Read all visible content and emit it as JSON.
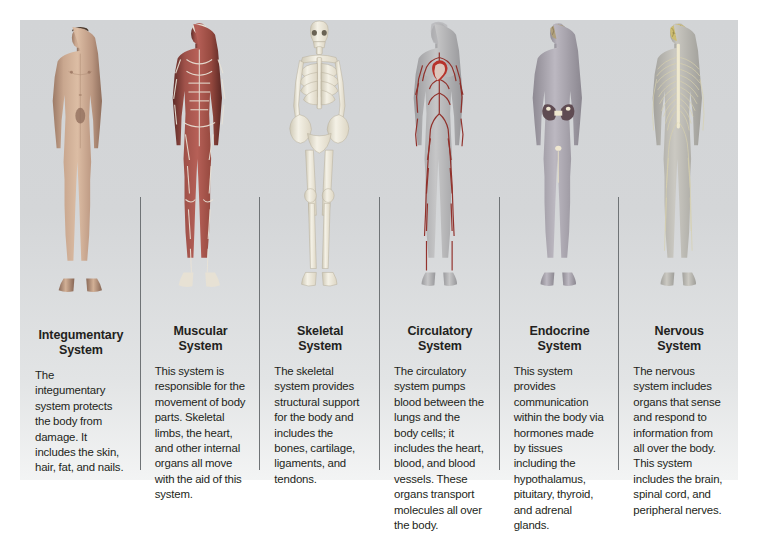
{
  "figure": {
    "top_clipped_text": "",
    "background_color": "#d3d5d7",
    "text_color": "#231f20",
    "divider_color": "#6f7376",
    "columns": [
      {
        "id": "integumentary",
        "title": "Integumentary\nSystem",
        "description": "The integumentary system protects the body from damage. It includes the skin, hair, fat, and nails.",
        "figure_name": "integumentary-body-figure",
        "figure_alt": "Front view of a male body showing intact skin",
        "accent": "#b08a72"
      },
      {
        "id": "muscular",
        "title": "Muscular\nSystem",
        "description": "This system is responsible for the movement of body parts. Skeletal limbs, the heart, and other internal organs all move with the aid of this system.",
        "figure_name": "muscular-body-figure",
        "figure_alt": "Front view of a body showing skeletal muscles",
        "accent": "#8c4a44"
      },
      {
        "id": "skeletal",
        "title": "Skeletal\nSystem",
        "description": "The skeletal system provides structural support for the body and includes the bones, cartilage, ligaments, and tendons.",
        "figure_name": "skeletal-body-figure",
        "figure_alt": "Front view of a human skeleton",
        "accent": "#efece2"
      },
      {
        "id": "circulatory",
        "title": "Circulatory\nSystem",
        "description": "The circulatory system pumps blood between the lungs and the body cells; it includes the heart, blood, and blood vessels. These organs transport molecules all over the body.",
        "figure_name": "circulatory-body-figure",
        "figure_alt": "Front view of a body showing heart and blood vessels",
        "accent": "#9e3b34"
      },
      {
        "id": "endocrine",
        "title": "Endocrine\nSystem",
        "description": "This system provides communication within the body via hormones made by tissues including the hypothalamus, pituitary, thyroid, and adrenal glands.",
        "figure_name": "endocrine-body-figure",
        "figure_alt": "Front view of a body showing endocrine glands",
        "accent": "#7d6a86"
      },
      {
        "id": "nervous",
        "title": "Nervous\nSystem",
        "description": "The nervous system includes organs that sense and respond to information from all over the body. This system includes the brain, spinal cord, and peripheral nerves.",
        "figure_name": "nervous-body-figure",
        "figure_alt": "Front view of a body showing brain, spinal cord and nerves",
        "accent": "#c8b86a"
      }
    ]
  }
}
